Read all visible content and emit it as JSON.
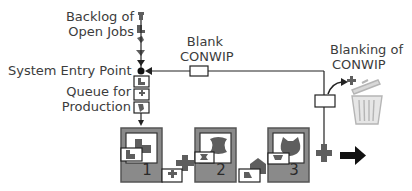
{
  "labels": {
    "backlog_line1": "Backlog of",
    "backlog_line2": "Open Jobs",
    "entry_point": "System Entry Point",
    "queue_line1": "Queue for",
    "queue_line2": "Production",
    "blank_line1": "Blank",
    "blank_line2": "CONWIP",
    "blanking_line1": "Blanking of",
    "blanking_line2": "CONWIP"
  },
  "stations": [
    {
      "number": "1"
    },
    {
      "number": "2"
    },
    {
      "number": "3"
    }
  ],
  "colors": {
    "line": "#222222",
    "station_fill": "#8a8a8a",
    "station_border": "#555555",
    "part_fill": "#5e5e5e",
    "card_fill": "#ffffff",
    "trash": "#bdbdbd"
  },
  "icons": [
    "trash-can-icon",
    "output-arrow-icon",
    "conwip-card-icon"
  ]
}
